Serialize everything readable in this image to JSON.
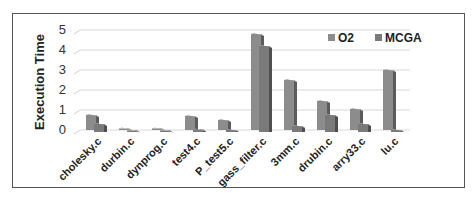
{
  "chart_data": {
    "type": "bar",
    "title": "",
    "xlabel": "",
    "ylabel": "Execution Time",
    "ylim": [
      0,
      5
    ],
    "yticks": [
      "0",
      "1",
      "2",
      "3",
      "4",
      "5"
    ],
    "grid": true,
    "legend_position": "top-right",
    "categories": [
      "cholesky.c",
      "durbin.c",
      "dynprog.c",
      "test4.c",
      "P_test5.c",
      "gass_filter.c",
      "3mm.c",
      "drubin.c",
      "arry33.c",
      "lu.c"
    ],
    "series": [
      {
        "name": "O2",
        "color": "#8c8c8c",
        "values": [
          0.75,
          0.05,
          0.08,
          0.7,
          0.5,
          4.8,
          2.5,
          1.45,
          1.05,
          3.0
        ]
      },
      {
        "name": "MCGA",
        "color": "#7a7a7a",
        "values": [
          0.4,
          0.05,
          0.05,
          0.12,
          0.1,
          4.3,
          0.3,
          0.85,
          0.4,
          0.1
        ]
      }
    ]
  },
  "legend": {
    "items": [
      "O2",
      "MCGA"
    ]
  },
  "axis": {
    "ylabel": "Execution Time"
  }
}
